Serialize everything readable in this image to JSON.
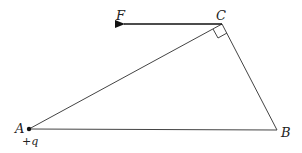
{
  "diagram": {
    "type": "triangle-force-diagram",
    "points": {
      "A": {
        "label": "A",
        "x": 29,
        "y": 129
      },
      "B": {
        "label": "B",
        "x": 277,
        "y": 130
      },
      "C": {
        "label": "C",
        "x": 222,
        "y": 24
      }
    },
    "charge_label": "+q",
    "force_label": "F",
    "right_angle_at": "C",
    "colors": {
      "line": "#444444",
      "arrow": "#111111"
    }
  }
}
